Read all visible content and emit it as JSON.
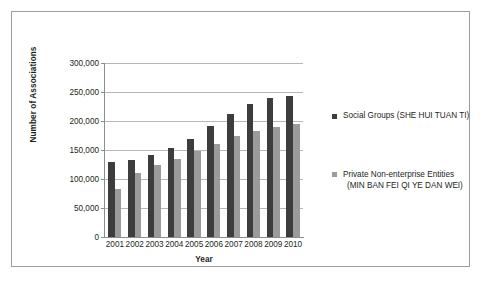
{
  "chart_data": {
    "type": "bar",
    "title": "",
    "xlabel": "Year",
    "ylabel": "Number of Associations",
    "categories": [
      "2001",
      "2002",
      "2003",
      "2004",
      "2005",
      "2006",
      "2007",
      "2008",
      "2009",
      "2010"
    ],
    "series": [
      {
        "name": "Social Groups (SHE HUI TUAN TI)",
        "color": "#3d3d3d",
        "values": [
          129000,
          133000,
          142000,
          153000,
          169000,
          192000,
          212000,
          230000,
          239000,
          243000
        ]
      },
      {
        "name": "Private Non-enterprise Entities (MIN BAN FEI QI YE DAN WEI)",
        "color": "#9b9b9b",
        "values": [
          82000,
          111000,
          124000,
          135000,
          148000,
          160000,
          174000,
          182000,
          190000,
          195000
        ]
      }
    ],
    "ylim": [
      0,
      300000
    ],
    "ytick_values": [
      0,
      50000,
      100000,
      150000,
      200000,
      250000,
      300000
    ],
    "ytick_labels": [
      "0",
      "50,000",
      "100,000",
      "150,000",
      "200,000",
      "250,000",
      "300,000"
    ],
    "grid": true,
    "legend_position": "right"
  },
  "legend": {
    "entries": [
      {
        "label_line1": "Social Groups (SHE HUI TUAN TI)",
        "label_line2": ""
      },
      {
        "label_line1": "Private Non-enterprise Entities",
        "label_line2": "(MIN BAN FEI QI YE DAN WEI)"
      }
    ]
  }
}
